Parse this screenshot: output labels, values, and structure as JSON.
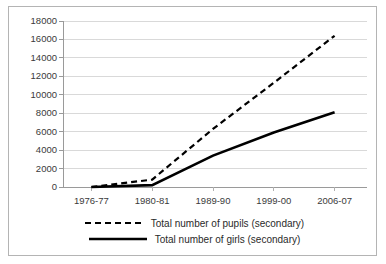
{
  "chart_data": {
    "type": "line",
    "title": "",
    "xlabel": "",
    "ylabel": "",
    "categories": [
      "1976-77",
      "1980-81",
      "1989-90",
      "1999-00",
      "2006-07"
    ],
    "ylim": [
      0,
      18000
    ],
    "ytick_step": 2000,
    "yticks": [
      "18000",
      "16000",
      "14000",
      "12000",
      "10000",
      "8000",
      "6000",
      "4000",
      "2000",
      "0"
    ],
    "grid": "horizontal",
    "legend_position": "bottom",
    "series": [
      {
        "name": "Total number of pupils (secondary)",
        "style": "dashed",
        "color": "#000000",
        "values": [
          0,
          800,
          6300,
          11300,
          16400
        ]
      },
      {
        "name": "Total number of girls (secondary)",
        "style": "solid",
        "color": "#000000",
        "values": [
          0,
          200,
          3400,
          5900,
          8100
        ]
      }
    ]
  },
  "legend": {
    "items": [
      {
        "label": "Total number of pupils (secondary)",
        "key": "dashed-line-key"
      },
      {
        "label": "Total number of girls (secondary)",
        "key": "solid-line-key"
      }
    ]
  }
}
